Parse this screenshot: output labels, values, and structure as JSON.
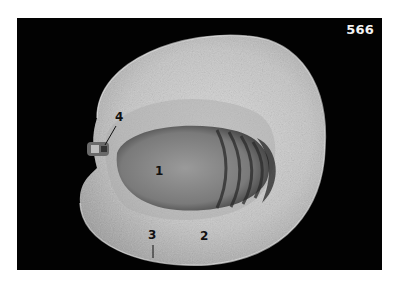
{
  "figure": {
    "number": "566",
    "background_color": "#020202",
    "callouts": [
      {
        "label": "1",
        "target": "stone"
      },
      {
        "label": "2",
        "target": "flesh"
      },
      {
        "label": "3",
        "target": "skin"
      },
      {
        "label": "4",
        "target": "stalk"
      }
    ]
  }
}
